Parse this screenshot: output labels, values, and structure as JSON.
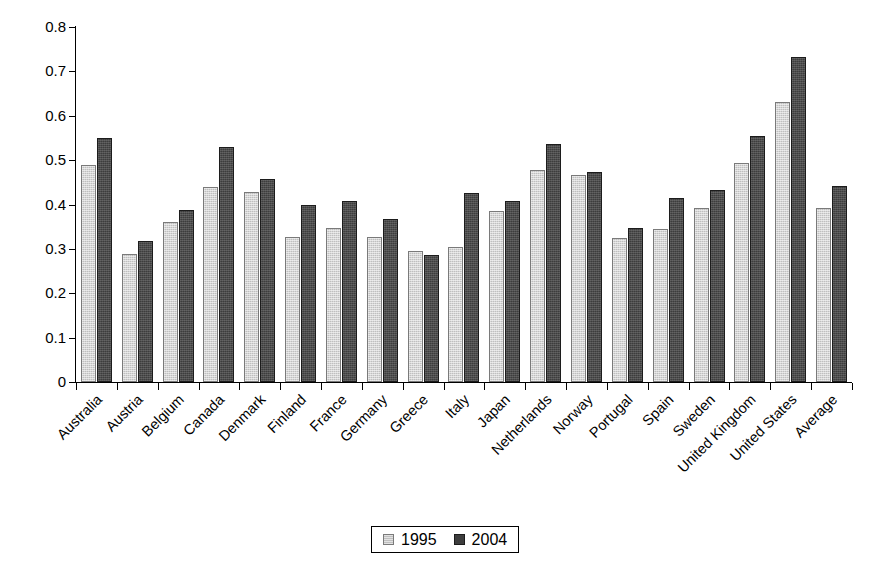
{
  "chart_data": {
    "type": "bar",
    "title": "",
    "subtitle": "",
    "xlabel": "",
    "ylabel": "",
    "ylim": [
      0,
      0.8
    ],
    "ytick_values": [
      0,
      0.1,
      0.2,
      0.3,
      0.4,
      0.5,
      0.6,
      0.7,
      0.8
    ],
    "ytick_labels": [
      "0",
      "0.1",
      "0.2",
      "0.3",
      "0.4",
      "0.5",
      "0.6",
      "0.7",
      "0.8"
    ],
    "grid": false,
    "legend_position": "bottom-center",
    "categories": [
      "Australia",
      "Austria",
      "Belgium",
      "Canada",
      "Denmark",
      "Finland",
      "France",
      "Germany",
      "Greece",
      "Italy",
      "Japan",
      "Netherlands",
      "Norway",
      "Portugal",
      "Spain",
      "Sweden",
      "United Kingdom",
      "United States",
      "Average"
    ],
    "series": [
      {
        "name": "1995",
        "color": "#bfbfbf",
        "values": [
          0.49,
          0.289,
          0.36,
          0.44,
          0.428,
          0.327,
          0.348,
          0.327,
          0.296,
          0.305,
          0.386,
          0.477,
          0.466,
          0.324,
          0.345,
          0.393,
          0.494,
          0.63,
          0.392
        ]
      },
      {
        "name": "2004",
        "color": "#3d3d3d",
        "values": [
          0.549,
          0.317,
          0.388,
          0.53,
          0.457,
          0.398,
          0.408,
          0.367,
          0.287,
          0.426,
          0.407,
          0.536,
          0.474,
          0.347,
          0.415,
          0.433,
          0.554,
          0.733,
          0.442
        ]
      }
    ],
    "annotations": []
  },
  "legend": {
    "items": [
      {
        "label": "1995",
        "swatch": "light-gray-swatch"
      },
      {
        "label": "2004",
        "swatch": "dark-gray-swatch"
      }
    ]
  }
}
